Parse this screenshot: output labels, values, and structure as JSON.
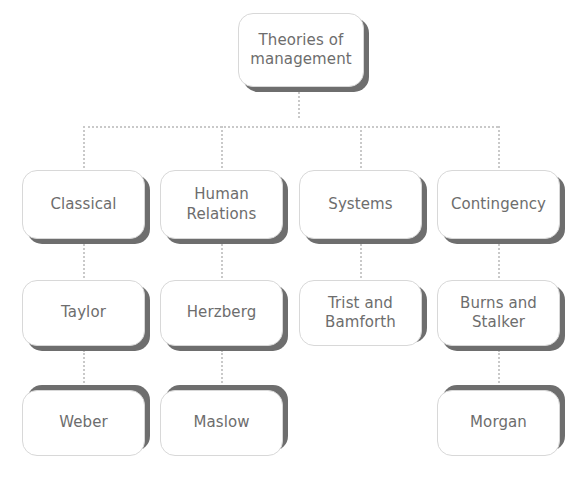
{
  "diagram": {
    "type": "hierarchy-tree",
    "title": "Theories of management",
    "orientation": "top-down",
    "colors": {
      "box_fill": "#ffffff",
      "box_border": "#d8d8d8",
      "box_shadow": "#6e6e6e",
      "text": "#6d6d6d",
      "connector": "#c9c9c9"
    },
    "root": {
      "id": "root",
      "label": "Theories of management"
    },
    "levels": [
      {
        "level": 1,
        "nodes": [
          {
            "id": "classical",
            "label": "Theories of management"
          }
        ]
      },
      {
        "level": 2,
        "nodes": [
          {
            "id": "cat-classical",
            "label": "Classical"
          },
          {
            "id": "cat-human",
            "label": "Human Relations"
          },
          {
            "id": "cat-systems",
            "label": "Systems"
          },
          {
            "id": "cat-contingency",
            "label": "Contingency"
          }
        ]
      },
      {
        "level": 3,
        "nodes": [
          {
            "id": "taylor",
            "label": "Taylor"
          },
          {
            "id": "herzberg",
            "label": "Herzberg"
          },
          {
            "id": "trist",
            "label": "Trist and Bamforth"
          },
          {
            "id": "burns",
            "label": "Burns and Stalker"
          }
        ]
      },
      {
        "level": 4,
        "nodes": [
          {
            "id": "weber",
            "label": "Weber"
          },
          {
            "id": "maslow",
            "label": "Maslow"
          },
          {
            "id": "morgan",
            "label": "Morgan"
          }
        ]
      }
    ],
    "node_labels": {
      "root": "Theories of management",
      "cat_classical": "Classical",
      "cat_human_line1": "Human",
      "cat_human_line2": "Relations",
      "cat_systems": "Systems",
      "cat_contingency": "Contingency",
      "taylor": "Taylor",
      "herzberg": "Herzberg",
      "trist_line1": "Trist and",
      "trist_line2": "Bamforth",
      "burns_line1": "Burns and",
      "burns_line2": "Stalker",
      "weber": "Weber",
      "maslow": "Maslow",
      "morgan": "Morgan"
    },
    "root_label_line1": "Theories of",
    "root_label_line2": "management",
    "edges": [
      {
        "from": "root",
        "to": "cat-classical"
      },
      {
        "from": "root",
        "to": "cat-human"
      },
      {
        "from": "root",
        "to": "cat-systems"
      },
      {
        "from": "root",
        "to": "cat-contingency"
      },
      {
        "from": "cat-classical",
        "to": "taylor"
      },
      {
        "from": "cat-human",
        "to": "herzberg"
      },
      {
        "from": "cat-systems",
        "to": "trist"
      },
      {
        "from": "cat-contingency",
        "to": "burns"
      },
      {
        "from": "taylor",
        "to": "weber"
      },
      {
        "from": "herzberg",
        "to": "maslow"
      },
      {
        "from": "burns",
        "to": "morgan"
      }
    ]
  }
}
